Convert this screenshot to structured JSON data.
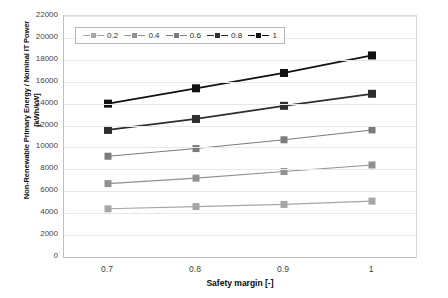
{
  "chart_data": {
    "type": "line",
    "title": "",
    "xlabel": "Safety margin [-]",
    "ylabel_line1": "Non-Renewable Primary Energy / Nominal IT Power",
    "ylabel_line2": "[kWh/kW]",
    "x": [
      0.7,
      0.8,
      0.9,
      1
    ],
    "xtick_labels": [
      "0.7",
      "0.8",
      "0.9",
      "1"
    ],
    "ytick_labels": [
      "0",
      "2000",
      "4000",
      "6000",
      "8000",
      "10000",
      "12000",
      "14000",
      "16000",
      "18000",
      "20000",
      "22000"
    ],
    "yticks": [
      0,
      2000,
      4000,
      6000,
      8000,
      10000,
      12000,
      14000,
      16000,
      18000,
      20000,
      22000
    ],
    "ylim": [
      0,
      22000
    ],
    "grid": true,
    "legend_position": "top-left-inside",
    "series": [
      {
        "name": "0.2",
        "values": [
          4400,
          4600,
          4800,
          5100
        ],
        "color": "#a6a6a6"
      },
      {
        "name": "0.4",
        "values": [
          6700,
          7200,
          7800,
          8400
        ],
        "color": "#919191"
      },
      {
        "name": "0.6",
        "values": [
          9200,
          9900,
          10700,
          11600
        ],
        "color": "#7b7b7b"
      },
      {
        "name": "0.8",
        "values": [
          11600,
          12600,
          13800,
          14900
        ],
        "color": "#2e2e2e"
      },
      {
        "name": "1",
        "values": [
          14000,
          15400,
          16800,
          18400
        ],
        "color": "#111111"
      }
    ]
  }
}
